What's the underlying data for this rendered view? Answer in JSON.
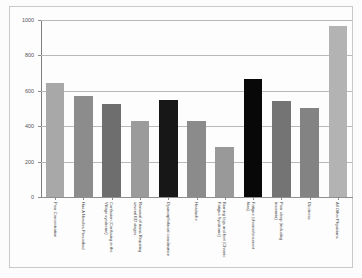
{
  "chart_data": {
    "type": "bar",
    "title": "",
    "subtitle": "",
    "xlabel": "",
    "ylabel": "",
    "ylim": [
      0,
      1000
    ],
    "yticks": [
      0,
      200,
      400,
      600,
      800,
      1000
    ],
    "grid": true,
    "legend": "none",
    "orientation": "vertical",
    "categories": [
      "Poor Concentration",
      "Has A Needles Prescribed",
      "Confusion (Confusing in the Village syndrome)",
      "Removal of items Requiring several ED stages",
      "Dysmorphofacial coordination",
      "Headache",
      "Burning legs and feet (Chronic Fatigue Syndrome)",
      "Fatigue (chronic/recurrent bias)",
      "Poor sleep (including insomnia)",
      "Dizziness",
      "All Other Physicians"
    ],
    "values": [
      645,
      570,
      525,
      430,
      550,
      432,
      285,
      668,
      543,
      502,
      968
    ],
    "bar_colors": [
      "#a8a8a8",
      "#8c8c8c",
      "#6e6e6e",
      "#9b9b9b",
      "#171717",
      "#8b8b8b",
      "#999999",
      "#080808",
      "#747474",
      "#838383",
      "#b3b3b3"
    ]
  },
  "axis": {
    "y_tick_labels": [
      "0",
      "200",
      "400",
      "600",
      "800",
      "1000"
    ]
  }
}
